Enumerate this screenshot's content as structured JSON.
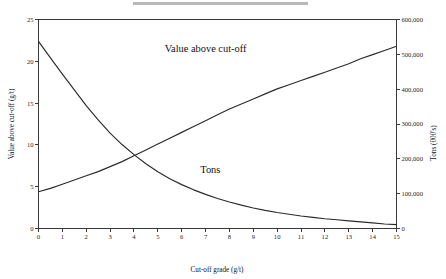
{
  "chart_data": {
    "type": "line",
    "title": "",
    "xlabel": "Cut-off grade (g/t)",
    "ylabel": "Value above cut-off (g/t)",
    "y2label": "Tons (000's)",
    "xlim": [
      0,
      15
    ],
    "ylim": [
      0,
      25
    ],
    "y2lim": [
      0,
      600000
    ],
    "grid": false,
    "legend_position": "inline-annotation",
    "xticks": [
      "0",
      "1",
      "2",
      "3",
      "4",
      "5",
      "6",
      "7",
      "8",
      "9",
      "10",
      "11",
      "12",
      "13",
      "14",
      "15"
    ],
    "xtick_values": [
      0,
      1,
      2,
      3,
      4,
      5,
      6,
      7,
      8,
      9,
      10,
      11,
      12,
      13,
      14,
      15
    ],
    "yticks": [
      "0",
      "5",
      "10",
      "15",
      "20",
      "25"
    ],
    "ytick_values": [
      0,
      5,
      10,
      15,
      20,
      25
    ],
    "y2ticks": [
      "0",
      "100,000",
      "200,000",
      "300,000",
      "400,000",
      "500,000",
      "600,000"
    ],
    "y2tick_values": [
      0,
      100000,
      200000,
      300000,
      400000,
      500000,
      600000
    ],
    "annotations": [
      {
        "text": "Value above cut-off",
        "x": 7.0,
        "y": 21.1
      },
      {
        "text": "Tons",
        "x": 7.2,
        "y": 6.6
      }
    ],
    "series": [
      {
        "name": "Tons",
        "axis": "right",
        "x": [
          0,
          0.5,
          1,
          1.5,
          2,
          2.5,
          3,
          3.5,
          4,
          4.5,
          5,
          5.5,
          6,
          6.5,
          7,
          7.5,
          8,
          8.5,
          9,
          9.5,
          10,
          10.5,
          11,
          11.5,
          12,
          12.5,
          13,
          13.5,
          14,
          14.5,
          15
        ],
        "values": [
          537000,
          490000,
          443000,
          398000,
          353000,
          312000,
          274000,
          241000,
          212000,
          186000,
          163000,
          143000,
          126000,
          111000,
          98000,
          86000,
          76000,
          67000,
          59000,
          52000,
          46000,
          41000,
          36000,
          32000,
          28000,
          25000,
          22000,
          19000,
          16000,
          13000,
          11000
        ]
      },
      {
        "name": "Value above cut-off",
        "axis": "left",
        "x": [
          0,
          0.5,
          1,
          1.5,
          2,
          2.5,
          3,
          3.5,
          4,
          4.5,
          5,
          5.5,
          6,
          6.5,
          7,
          7.5,
          8,
          8.5,
          9,
          9.5,
          10,
          10.5,
          11,
          11.5,
          12,
          12.5,
          13,
          13.5,
          14,
          14.5,
          15
        ],
        "values": [
          4.4,
          4.8,
          5.3,
          5.8,
          6.3,
          6.8,
          7.4,
          8.0,
          8.7,
          9.4,
          10.1,
          10.8,
          11.5,
          12.2,
          12.9,
          13.6,
          14.3,
          14.9,
          15.5,
          16.1,
          16.7,
          17.2,
          17.7,
          18.2,
          18.7,
          19.2,
          19.7,
          20.3,
          20.8,
          21.3,
          21.8
        ]
      }
    ]
  },
  "style": {
    "axis_color": "#3a3a3a",
    "curve_color": "#2b2b2b",
    "text_color": "#111111",
    "background": "#ffffff"
  }
}
